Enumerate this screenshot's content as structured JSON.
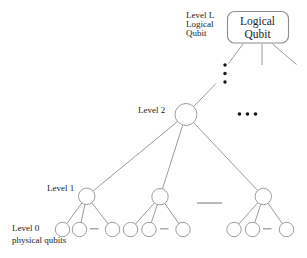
{
  "colors": {
    "background": "#ffffff",
    "line": "#9c9c9c",
    "node_stroke": "#9c9c9c",
    "node_fill": "#ffffff",
    "box_stroke": "#8c8c8c",
    "dash": "#8a8a8a",
    "dot": "#151515",
    "text": "#1c1c1c"
  },
  "labels": {
    "level_l_annotation": [
      "Level L",
      "Logical",
      "Qubit"
    ],
    "logical_qubit_box": [
      "Logical",
      "Qubit"
    ],
    "level_2": "Level 2",
    "level_1": "Level 1",
    "level_0": [
      "Level 0",
      "physical qubits"
    ]
  },
  "structure": {
    "type": "tree-diagram",
    "branching_factor": 3,
    "levels": [
      {
        "name": "Level L",
        "node_count": 1,
        "node_shape": "rounded-box",
        "node_label": "Logical Qubit"
      },
      {
        "name": "Level 2",
        "node_count": 1,
        "node_shape": "circle"
      },
      {
        "name": "Level 1",
        "node_count": 3,
        "node_shape": "circle"
      },
      {
        "name": "Level 0",
        "node_count": 9,
        "node_shape": "circle",
        "node_label": "physical qubits"
      }
    ],
    "ellipses": [
      "vertical three-dot ellipsis between Logical Qubit box and Level 2 node",
      "horizontal three-dot ellipsis to the right of Level 2 node",
      "horizontal omission dashes between sibling nodes at Level 1 and Level 0"
    ]
  }
}
